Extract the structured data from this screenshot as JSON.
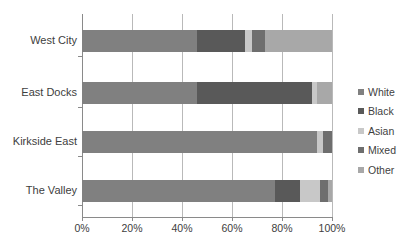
{
  "chart_data": {
    "type": "bar",
    "orientation": "horizontal",
    "stacked": true,
    "normalized": true,
    "title": "",
    "xlabel": "",
    "ylabel": "",
    "xlim": [
      0,
      100
    ],
    "xticks": [
      0,
      20,
      40,
      60,
      80,
      100
    ],
    "xticklabels": [
      "0%",
      "20%",
      "40%",
      "60%",
      "80%",
      "100%"
    ],
    "grid": true,
    "legend_position": "right",
    "categories": [
      "West City",
      "East Docks",
      "Kirkside East",
      "The Valley"
    ],
    "series": [
      {
        "name": "White",
        "color": "#808080",
        "values": [
          46,
          46,
          94,
          77
        ]
      },
      {
        "name": "Black",
        "color": "#595959",
        "values": [
          19,
          46,
          0,
          10
        ]
      },
      {
        "name": "Asian",
        "color": "#c8c8c8",
        "values": [
          3,
          2,
          2.5,
          8
        ]
      },
      {
        "name": "Mixed",
        "color": "#6e6e6e",
        "values": [
          5,
          0,
          3.5,
          3.5
        ]
      },
      {
        "name": "Other",
        "color": "#a8a8a8",
        "values": [
          27,
          6,
          0,
          1.5
        ]
      }
    ]
  },
  "axis": {
    "tick_color": "#8a8a8a",
    "grid_color": "#b9b9b9",
    "label_color": "#404040"
  }
}
